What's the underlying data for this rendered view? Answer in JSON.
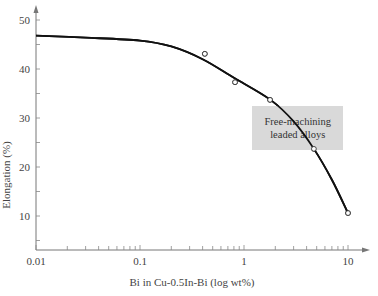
{
  "chart_data": {
    "type": "line",
    "title": "",
    "xlabel": "Bi in Cu-0.5In-Bi (log wt%)",
    "ylabel": "Elongation (%)",
    "xscale": "log",
    "xlim": [
      0.01,
      15
    ],
    "ylim": [
      3.5,
      53
    ],
    "x_ticks": [
      0.01,
      0.1,
      1,
      10
    ],
    "x_tick_labels": [
      "0.01",
      "0.1",
      "1",
      "10"
    ],
    "y_ticks": [
      10,
      20,
      30,
      40,
      50
    ],
    "y_tick_labels": [
      "10",
      "20",
      "30",
      "40",
      "50"
    ],
    "grid": false,
    "legend": null,
    "series": [
      {
        "name": "Fitted curve",
        "style": "line",
        "x": [
          0.01,
          0.03,
          0.1,
          0.2,
          0.4,
          0.8,
          1.8,
          3.0,
          4.7,
          7.0,
          10
        ],
        "y": [
          46.8,
          46.4,
          45.8,
          44.6,
          42.0,
          38.2,
          33.7,
          29.3,
          23.7,
          17.4,
          10.6
        ]
      },
      {
        "name": "Measured data",
        "style": "open-circle-markers",
        "x": [
          0.42,
          0.82,
          1.78,
          4.7,
          10
        ],
        "y": [
          43.1,
          37.3,
          33.7,
          23.7,
          10.6
        ]
      }
    ],
    "annotations": [
      {
        "text_lines": [
          "Free-machining",
          "leaded alloys"
        ],
        "x_range": [
          1.2,
          9.0
        ],
        "y_range": [
          23.5,
          32.5
        ],
        "background": "#d9d9d9"
      }
    ]
  },
  "annotation": {
    "line1": "Free-machining",
    "line2": "leaded alloys"
  },
  "axes": {
    "xlabel": "Bi in Cu-0.5In-Bi (log wt%)",
    "ylabel": "Elongation (%)"
  }
}
